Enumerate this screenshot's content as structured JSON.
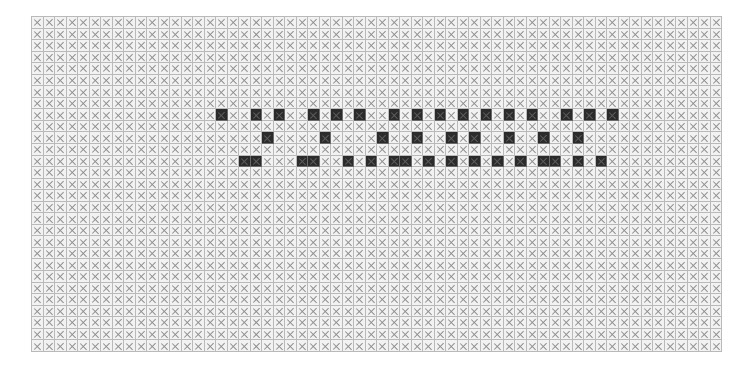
{
  "document": {
    "title": "Grid Pattern",
    "type": "cell-grid-matrix"
  },
  "grid": {
    "columns": 60,
    "rows": 29,
    "cell_size_px": 11.5,
    "origin_x_px": 31,
    "origin_y_px": 16,
    "mark_glyph": "x",
    "mark_icon_name": "cross-mark-icon",
    "colors": {
      "page_background": "#ffffff",
      "cell_empty_fill": "#f2f2f2",
      "cell_filled_fill": "#2b2b2b",
      "cell_border": "#b9b9b9",
      "cell_filled_border": "#6a6a6a",
      "mark_stroke": "#8d8d8d",
      "mark_stroke_on_filled": "#5e5e5e"
    },
    "legend": {
      "empty_label": "empty cell",
      "filled_label": "filled cell",
      "marked_label": "marked cell"
    },
    "filled_cells": {
      "8": [
        16,
        19,
        21,
        24,
        26,
        28,
        31,
        33,
        35,
        37,
        39,
        41,
        43,
        46,
        48,
        50
      ],
      "9": [],
      "10": [
        20,
        25,
        30,
        33,
        36,
        38,
        41,
        44,
        47
      ],
      "11": [],
      "12": [
        18,
        19,
        23,
        24,
        27,
        29,
        31,
        32,
        34,
        36,
        38,
        40,
        42,
        44,
        45,
        47,
        49
      ]
    },
    "counts": {
      "total_cells": 1740,
      "filled_total": 42,
      "marked_total": 1740
    }
  }
}
